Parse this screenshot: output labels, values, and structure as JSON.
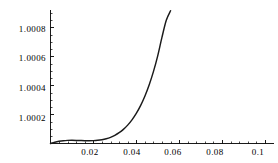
{
  "figure": {
    "background_color": "#ffffff",
    "axis_color": "#000000",
    "curve_color": "#1a1a1a"
  },
  "chart_data": {
    "type": "line",
    "title": "",
    "subtitle": "",
    "xlabel": "",
    "ylabel": "",
    "grid": false,
    "legend": null,
    "xlim": [
      0.0,
      0.104
    ],
    "ylim": [
      1.0,
      1.00092
    ],
    "x_ticks": [
      0.02,
      0.04,
      0.06,
      0.08,
      0.1
    ],
    "x_tick_labels": [
      "0.02",
      "0.04",
      "0.06",
      "0.08",
      "0.1"
    ],
    "x_minor_tick_step": 0.004,
    "y_ticks": [
      1.0002,
      1.0004,
      1.0006,
      1.0008
    ],
    "y_tick_labels": [
      "1.0002",
      "1.0004",
      "1.0006",
      "1.0008"
    ],
    "y_minor_tick_step": 5e-05,
    "series": [
      {
        "name": "curve",
        "x": [
          0.0,
          0.002,
          0.004,
          0.006,
          0.008,
          0.01,
          0.012,
          0.014,
          0.016,
          0.018,
          0.02,
          0.022,
          0.024,
          0.026,
          0.028,
          0.03,
          0.032,
          0.034,
          0.036,
          0.038,
          0.04,
          0.042,
          0.044,
          0.046,
          0.048,
          0.05,
          0.052,
          0.054,
          0.056
        ],
        "y": [
          1.0,
          1.000009,
          1.0000155,
          1.0000196,
          1.0000215,
          1.0000219,
          1.0000213,
          1.0000203,
          1.0000194,
          1.0000191,
          1.0000198,
          1.000022,
          1.0000262,
          1.0000329,
          1.0000427,
          1.0000563,
          1.0000743,
          1.0000975,
          1.0001267,
          1.000163,
          1.0002074,
          1.0002612,
          1.0003258,
          1.0004031,
          1.000495,
          1.000604,
          1.000733,
          1.000849,
          1.000915
        ]
      }
    ]
  },
  "axis_labels": {
    "y": [
      "1.0008",
      "1.0006",
      "1.0004",
      "1.0002"
    ],
    "x": [
      "0.02",
      "0.04",
      "0.06",
      "0.08",
      "0.1"
    ]
  }
}
